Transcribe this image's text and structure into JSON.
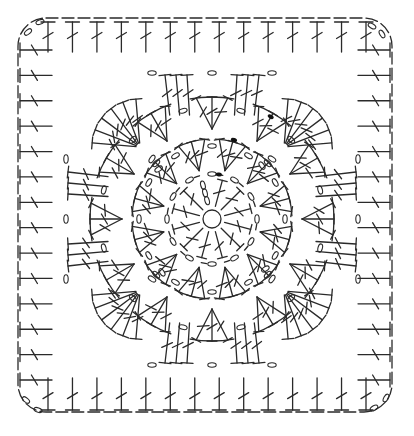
{
  "diagram": {
    "type": "crochet-chart",
    "width": 414,
    "height": 436,
    "center": {
      "x": 212,
      "y": 219
    },
    "colors": {
      "ink": "#2a2a2a",
      "slip_stitch": "#111111",
      "background": "#ffffff"
    },
    "legend_symbols": {
      "magic_ring": "circle",
      "chain": "small oval (0)",
      "slip_stitch": "filled dot",
      "double_crochet": "T with one slash",
      "dc_cluster": "fan of dc joined at base"
    },
    "rounds": [
      {
        "round": 0,
        "name": "magic-ring",
        "radius": 9
      },
      {
        "round": 1,
        "name": "dc-round",
        "stitch": "dc",
        "count": 12,
        "inner_r": 13,
        "outer_r": 40,
        "start_chain": 3
      },
      {
        "round": 2,
        "name": "chain-ring",
        "stitch": "ch",
        "count": 12,
        "radius": 45
      },
      {
        "round": 3,
        "name": "cluster-round",
        "stitch": "3-dc fan",
        "count": 12,
        "inner_r": 50,
        "outer_r": 80,
        "chain_between": 1,
        "start_chain": 3
      },
      {
        "round": 4,
        "name": "cluster-round-2",
        "stitch": "3-dc fan",
        "count": 12,
        "inner_r": 90,
        "outer_r": 122,
        "chain_between": 1,
        "start_chain": 4
      },
      {
        "round": 5,
        "name": "squaring-round",
        "stitch": "3-dc groups + corner fans",
        "side_groups": 2,
        "corner_fan": 6,
        "chain_between": 1
      },
      {
        "round": 6,
        "name": "border-round",
        "stitch": "dc",
        "per_side": 14,
        "corner_chains": 2
      }
    ],
    "frame": {
      "left": 18,
      "top": 18,
      "right": 392,
      "bottom": 412,
      "corner_radius": 28
    }
  }
}
